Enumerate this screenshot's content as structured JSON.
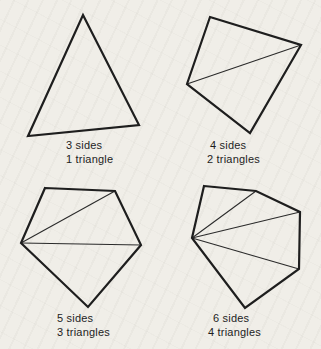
{
  "colors": {
    "paper": "#f0eee8",
    "outline": "#1e1e1e",
    "diagonal": "#2a2a2a",
    "text": "#1d1d1d"
  },
  "panels": [
    {
      "name": "triangle",
      "sides_label": "3 sides",
      "triangles_label": "1 triangle",
      "label_pos": {
        "x": 66,
        "y": 139
      },
      "polygon": [
        [
          83,
          15
        ],
        [
          139,
          125
        ],
        [
          28,
          136
        ]
      ],
      "diagonals": []
    },
    {
      "name": "quadrilateral",
      "sides_label": "4 sides",
      "triangles_label": "2 triangles",
      "label_pos": {
        "x": 207,
        "y": 139
      },
      "polygon": [
        [
          210,
          17
        ],
        [
          301,
          45
        ],
        [
          250,
          133
        ],
        [
          187,
          84
        ]
      ],
      "diagonals": [
        [
          [
            187,
            84
          ],
          [
            301,
            45
          ]
        ]
      ]
    },
    {
      "name": "pentagon",
      "sides_label": "5 sides",
      "triangles_label": "3 triangles",
      "label_pos": {
        "x": 57,
        "y": 312
      },
      "polygon": [
        [
          45,
          188
        ],
        [
          115,
          191
        ],
        [
          141,
          245
        ],
        [
          88,
          307
        ],
        [
          21,
          243
        ]
      ],
      "diagonals": [
        [
          [
            21,
            243
          ],
          [
            115,
            191
          ]
        ],
        [
          [
            21,
            243
          ],
          [
            141,
            245
          ]
        ]
      ]
    },
    {
      "name": "hexagon",
      "sides_label": "6 sides",
      "triangles_label": "4 triangles",
      "label_pos": {
        "x": 208,
        "y": 312
      },
      "polygon": [
        [
          204,
          186
        ],
        [
          256,
          191
        ],
        [
          300,
          212
        ],
        [
          299,
          269
        ],
        [
          245,
          308
        ],
        [
          192,
          238
        ]
      ],
      "diagonals": [
        [
          [
            192,
            238
          ],
          [
            256,
            191
          ]
        ],
        [
          [
            192,
            238
          ],
          [
            300,
            212
          ]
        ],
        [
          [
            192,
            238
          ],
          [
            299,
            269
          ]
        ]
      ]
    }
  ]
}
